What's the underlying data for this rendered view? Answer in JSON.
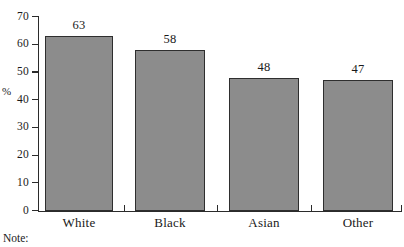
{
  "chart_data": {
    "type": "bar",
    "title": "",
    "subtitle": "",
    "xlabel": "",
    "ylabel": "%",
    "categories": [
      "White",
      "Black",
      "Asian",
      "Other"
    ],
    "values": [
      63,
      58,
      48,
      47
    ],
    "value_labels": [
      "63",
      "58",
      "48",
      "47"
    ],
    "ylim": [
      0,
      70
    ],
    "ytick_values": [
      0,
      10,
      20,
      30,
      40,
      50,
      60,
      70
    ],
    "ytick_labels": [
      "0",
      "10",
      "20",
      "30",
      "40",
      "50",
      "60",
      "70"
    ],
    "grid": false,
    "legend": null,
    "bar_color": "#8c8c8c",
    "bar_border_color": "#2e2e2e",
    "axis_color": "#2b2b2b",
    "background": "#ffffff"
  },
  "footer": {
    "note_label": "Note:"
  }
}
